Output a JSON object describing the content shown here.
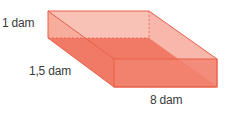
{
  "diagram": {
    "type": "rectangular-prism",
    "labels": {
      "height": "1 dam",
      "depth": "1,5 dam",
      "length": "8 dam"
    },
    "colors": {
      "face_light": "#f8b9ac",
      "face_mid": "#f39a88",
      "face_dark": "#ef7560",
      "edge": "#e8604a"
    }
  }
}
